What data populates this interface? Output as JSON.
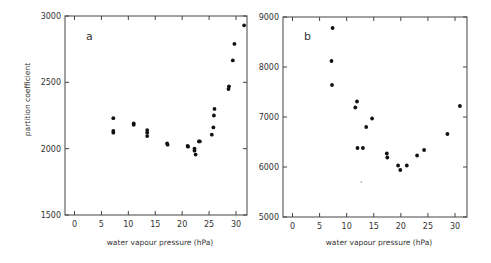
{
  "chart_data": [
    {
      "type": "scatter",
      "panel_label": "a",
      "title": "",
      "xlabel": "water vapour pressure (hPa)",
      "ylabel": "partition coefficient",
      "xlim": [
        -2,
        32
      ],
      "ylim": [
        1500,
        3000
      ],
      "xticks": [
        0,
        5,
        10,
        15,
        20,
        25,
        30
      ],
      "yticks": [
        1500,
        2000,
        2500,
        3000
      ],
      "grid": false,
      "legend": null,
      "series": [
        {
          "name": "a",
          "points": [
            [
              7.2,
              2230
            ],
            [
              7.2,
              2135
            ],
            [
              7.2,
              2120
            ],
            [
              11.0,
              2190
            ],
            [
              11.0,
              2180
            ],
            [
              13.5,
              2140
            ],
            [
              13.5,
              2120
            ],
            [
              13.5,
              2095
            ],
            [
              17.2,
              2040
            ],
            [
              17.3,
              2030
            ],
            [
              21.0,
              2020
            ],
            [
              21.1,
              2015
            ],
            [
              22.3,
              2000
            ],
            [
              22.3,
              1985
            ],
            [
              22.5,
              1955
            ],
            [
              23.1,
              2055
            ],
            [
              23.3,
              2055
            ],
            [
              25.5,
              2105
            ],
            [
              25.8,
              2160
            ],
            [
              25.9,
              2250
            ],
            [
              26.0,
              2300
            ],
            [
              28.6,
              2450
            ],
            [
              28.7,
              2470
            ],
            [
              29.4,
              2665
            ],
            [
              29.7,
              2790
            ],
            [
              31.5,
              2930
            ]
          ]
        }
      ]
    },
    {
      "type": "scatter",
      "panel_label": "b",
      "title": "",
      "xlabel": "water vapour pressure (hPa)",
      "ylabel": "",
      "xlim": [
        -2,
        32
      ],
      "ylim": [
        5000,
        9000
      ],
      "xticks": [
        0,
        5,
        10,
        15,
        20,
        25,
        30
      ],
      "yticks": [
        5000,
        6000,
        7000,
        8000,
        9000
      ],
      "grid": false,
      "legend": null,
      "series": [
        {
          "name": "b",
          "points": [
            [
              7.4,
              8780
            ],
            [
              7.2,
              8120
            ],
            [
              7.3,
              7640
            ],
            [
              11.6,
              7190
            ],
            [
              11.9,
              7310
            ],
            [
              12.0,
              6380
            ],
            [
              13.0,
              6380
            ],
            [
              13.6,
              6800
            ],
            [
              14.7,
              6970
            ],
            [
              17.4,
              6270
            ],
            [
              17.5,
              6190
            ],
            [
              19.5,
              6030
            ],
            [
              19.9,
              5940
            ],
            [
              21.1,
              6030
            ],
            [
              23.0,
              6230
            ],
            [
              24.3,
              6340
            ],
            [
              28.6,
              6660
            ],
            [
              30.9,
              7220
            ]
          ]
        }
      ],
      "annotations": [
        {
          "type": "stray-mark",
          "x": 12.7,
          "y": 5700
        }
      ]
    }
  ]
}
